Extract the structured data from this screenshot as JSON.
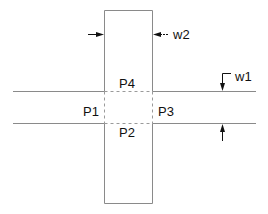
{
  "diagram": {
    "type": "cross-junction layout",
    "ports": [
      {
        "id": "p1",
        "label": "P1"
      },
      {
        "id": "p2",
        "label": "P2"
      },
      {
        "id": "p3",
        "label": "P3"
      },
      {
        "id": "p4",
        "label": "P4"
      }
    ],
    "dimensions": [
      {
        "id": "w1",
        "label": "w1",
        "describes": "width of horizontal strip"
      },
      {
        "id": "w2",
        "label": "w2",
        "describes": "width of vertical strip"
      }
    ]
  }
}
